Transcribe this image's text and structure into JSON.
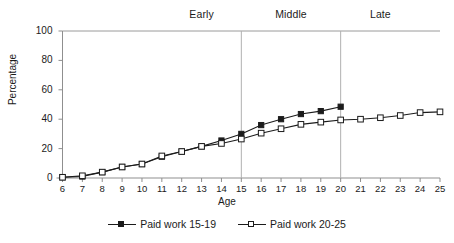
{
  "chart_data": {
    "type": "line",
    "title": "",
    "subtitle": "",
    "xlabel": "Age",
    "ylabel": "Percentage",
    "x": [
      6,
      7,
      8,
      9,
      10,
      11,
      12,
      13,
      14,
      15,
      16,
      17,
      18,
      19,
      20,
      21,
      22,
      23,
      24,
      25
    ],
    "xlim": [
      6,
      25
    ],
    "ylim": [
      0,
      100
    ],
    "yticks": [
      0,
      20,
      40,
      60,
      80,
      100
    ],
    "xticks": [
      6,
      7,
      8,
      9,
      10,
      11,
      12,
      13,
      14,
      15,
      16,
      17,
      18,
      19,
      20,
      21,
      22,
      23,
      24,
      25
    ],
    "grid": false,
    "legend_position": "bottom-center",
    "series": [
      {
        "name": "Paid work 15-19",
        "marker": "filled-square",
        "color": "#1b1b1b",
        "x": [
          6,
          7,
          8,
          9,
          10,
          11,
          12,
          13,
          14,
          15,
          16,
          17,
          18,
          19,
          20
        ],
        "values": [
          0.5,
          1.0,
          4.0,
          7.5,
          9.5,
          14.5,
          18.0,
          21.5,
          25.5,
          30.0,
          36.0,
          40.0,
          43.5,
          45.5,
          48.5
        ]
      },
      {
        "name": "Paid work 20-25",
        "marker": "open-square",
        "color": "#1b1b1b",
        "x": [
          6,
          7,
          8,
          9,
          10,
          11,
          12,
          13,
          14,
          15,
          16,
          17,
          18,
          19,
          20,
          21,
          22,
          23,
          24,
          25
        ],
        "values": [
          0.5,
          1.5,
          4.0,
          7.5,
          9.5,
          15.0,
          18.0,
          21.5,
          23.5,
          26.5,
          30.5,
          33.5,
          36.5,
          38.0,
          39.5,
          40.0,
          41.0,
          42.5,
          44.5,
          45.0
        ]
      }
    ],
    "annotations": {
      "stage_dividers": [
        15,
        20
      ],
      "bands": [
        {
          "label": "Early",
          "center_age": 13.0
        },
        {
          "label": "Middle",
          "center_age": 17.5
        },
        {
          "label": "Late",
          "center_age": 22.0
        }
      ]
    }
  },
  "legend": {
    "entries": [
      {
        "label": "Paid work 15-19"
      },
      {
        "label": "Paid work 20-25"
      }
    ]
  }
}
